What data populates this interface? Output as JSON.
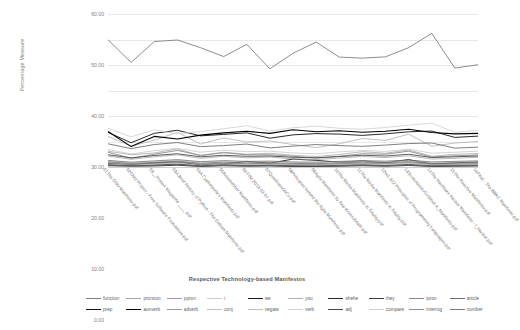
{
  "chart_data": {
    "type": "line",
    "title": "",
    "xlabel": "Respective Technology-based Manifestos",
    "ylabel": "Percentage Measure",
    "ylim": [
      0,
      60
    ],
    "yticks": [
      "0.00",
      "10.00",
      "20.00",
      "30.00",
      "40.00",
      "50.00",
      "60.00"
    ],
    "grid": true,
    "legend_position": "bottom",
    "categories": [
      "01The GNU Manifesto.pdf",
      "02GNU Project - Free Software Foundation.pdf",
      "03__Plone4 Magazine ____.pdf",
      "03A Brief History of Python - The Debian Manifesto.pdf",
      "04A Cypherpunk's Manifesto.pdf",
      "05Indiewebber Manifesto.pdf",
      "06TTM-2013-02-07.pdf",
      "07QuestionsOnCo.pdf",
      "08Principles behind the Agile Manifesto.pdf",
      "09Agile Manifesto by Ana Kronschnabl.pdf",
      "10The Media Manifesto in Totality.pdf",
      "11The Media Manifesto in Totality.pdf",
      "12m1-312 Principles of Programming Languages.pdf",
      "13TocksAndSoGoSmet-A_Manifesto.pdf",
      "14The Hardware Hacker Manifesto - I_Hacker.pdf",
      "15The Reactive Manifesto.pdf",
      "16Final - The BBKC Manifesto.pdf"
    ],
    "series": [
      {
        "name": "function",
        "color": "#808080",
        "width": 0.9,
        "values": [
          49.9,
          41.0,
          49.2,
          49.8,
          46.8,
          43.3,
          48.1,
          38.5,
          44.6,
          49.0,
          43.1,
          42.7,
          43.2,
          46.8,
          52.4,
          38.8,
          40.1
        ]
      },
      {
        "name": "pronoun",
        "color": "#a6a6a6",
        "width": 0.7,
        "values": [
          12.0,
          8.2,
          10.5,
          13.6,
          9.0,
          11.4,
          9.8,
          10.2,
          8.8,
          7.6,
          9.1,
          11.2,
          10.4,
          12.9,
          8.1,
          9.4,
          10.0
        ]
      },
      {
        "name": "ppron",
        "color": "#9c9c9c",
        "width": 0.7,
        "values": [
          6.2,
          4.8,
          5.5,
          7.1,
          4.4,
          5.8,
          5.0,
          5.4,
          4.6,
          4.1,
          4.9,
          6.0,
          5.4,
          6.7,
          4.2,
          5.0,
          5.3
        ]
      },
      {
        "name": "i",
        "color": "#cccccc",
        "width": 0.7,
        "values": [
          2.1,
          1.2,
          1.8,
          2.4,
          1.0,
          1.6,
          1.1,
          1.4,
          0.9,
          0.8,
          1.2,
          1.7,
          1.3,
          2.0,
          0.9,
          1.1,
          1.4
        ]
      },
      {
        "name": "we",
        "color": "#1a1a1a",
        "width": 0.9,
        "values": [
          1.4,
          0.9,
          1.6,
          2.0,
          0.8,
          1.2,
          2.2,
          1.5,
          3.1,
          2.6,
          1.9,
          2.4,
          1.7,
          2.9,
          1.2,
          1.6,
          2.0
        ]
      },
      {
        "name": "you",
        "color": "#b0b0b0",
        "width": 0.7,
        "values": [
          1.0,
          0.6,
          0.9,
          1.5,
          0.5,
          1.1,
          0.7,
          0.9,
          0.6,
          0.5,
          0.8,
          1.0,
          0.7,
          1.2,
          0.6,
          0.8,
          0.9
        ]
      },
      {
        "name": "shehe",
        "color": "#2b2b2b",
        "width": 0.9,
        "values": [
          0.5,
          0.3,
          0.4,
          0.7,
          0.2,
          0.5,
          0.3,
          0.4,
          0.2,
          0.2,
          0.3,
          0.5,
          0.3,
          0.6,
          0.2,
          0.3,
          0.4
        ]
      },
      {
        "name": "they",
        "color": "#3d3d3d",
        "width": 0.9,
        "values": [
          0.9,
          0.6,
          0.8,
          1.1,
          0.5,
          0.9,
          0.6,
          0.8,
          0.5,
          0.4,
          0.7,
          0.9,
          0.6,
          1.0,
          0.5,
          0.7,
          0.8
        ]
      },
      {
        "name": "ipron",
        "color": "#8a8a8a",
        "width": 0.9,
        "values": [
          5.8,
          3.4,
          5.0,
          6.5,
          4.6,
          5.6,
          4.8,
          4.8,
          4.2,
          3.5,
          4.2,
          5.2,
          5.0,
          6.2,
          3.9,
          4.4,
          4.7
        ]
      },
      {
        "name": "article",
        "color": "#707070",
        "width": 0.9,
        "values": [
          9.1,
          7.2,
          8.8,
          9.6,
          8.0,
          8.4,
          9.0,
          7.5,
          8.2,
          8.8,
          8.4,
          8.1,
          8.6,
          9.2,
          9.4,
          7.4,
          7.8
        ]
      },
      {
        "name": "prep",
        "color": "#111111",
        "width": 0.9,
        "values": [
          13.6,
          9.5,
          13.2,
          14.4,
          12.2,
          12.8,
          13.4,
          11.3,
          12.6,
          13.1,
          12.9,
          12.4,
          13.0,
          13.8,
          14.1,
          11.6,
          12.1
        ]
      },
      {
        "name": "auxverb",
        "color": "#000000",
        "width": 1.1,
        "values": [
          13.9,
          8.0,
          12.0,
          11.0,
          12.5,
          13.4,
          14.0,
          13.2,
          14.6,
          13.8,
          14.2,
          13.6,
          14.0,
          14.8,
          13.5,
          13.0,
          13.2
        ]
      },
      {
        "name": "adverb",
        "color": "#9a9a9a",
        "width": 0.7,
        "values": [
          4.3,
          3.0,
          4.0,
          4.8,
          3.4,
          4.2,
          3.6,
          3.9,
          3.2,
          2.9,
          3.5,
          4.1,
          3.7,
          4.4,
          3.1,
          3.4,
          3.8
        ]
      },
      {
        "name": "conj",
        "color": "#c2c2c2",
        "width": 0.7,
        "values": [
          6.9,
          5.1,
          6.4,
          7.3,
          5.8,
          6.6,
          6.0,
          6.2,
          5.5,
          5.2,
          5.9,
          6.5,
          6.1,
          7.0,
          5.4,
          5.8,
          6.2
        ]
      },
      {
        "name": "negate",
        "color": "#bdbdbd",
        "width": 0.7,
        "values": [
          1.2,
          0.8,
          1.1,
          1.5,
          0.7,
          1.2,
          0.9,
          1.1,
          0.8,
          0.6,
          1.0,
          1.2,
          0.9,
          1.3,
          0.7,
          0.9,
          1.0
        ]
      },
      {
        "name": "verb",
        "color": "#d4d4d4",
        "width": 0.9,
        "values": [
          15.2,
          11.8,
          14.6,
          13.0,
          13.9,
          15.0,
          16.2,
          14.1,
          15.4,
          16.0,
          15.2,
          14.8,
          15.5,
          16.4,
          17.2,
          13.6,
          14.4
        ]
      },
      {
        "name": "adj",
        "color": "#4a4a4a",
        "width": 0.9,
        "values": [
          4.8,
          3.6,
          4.5,
          5.2,
          4.0,
          4.6,
          4.2,
          4.3,
          3.8,
          3.6,
          4.1,
          4.6,
          4.3,
          5.0,
          3.7,
          4.0,
          4.3
        ]
      },
      {
        "name": "compare",
        "color": "#cfcfcf",
        "width": 0.7,
        "values": [
          2.4,
          1.8,
          2.2,
          2.7,
          1.9,
          2.3,
          2.0,
          2.1,
          1.8,
          1.7,
          2.0,
          2.3,
          2.1,
          2.5,
          1.8,
          2.0,
          2.2
        ]
      },
      {
        "name": "interrog",
        "color": "#8f8f8f",
        "width": 0.9,
        "values": [
          1.6,
          1.1,
          1.4,
          1.9,
          1.2,
          1.5,
          1.3,
          1.4,
          1.1,
          1.0,
          1.3,
          1.5,
          1.3,
          1.7,
          1.1,
          1.2,
          1.4
        ]
      },
      {
        "name": "number",
        "color": "#7a7a7a",
        "width": 0.9,
        "values": [
          2.0,
          1.4,
          1.8,
          2.3,
          1.5,
          1.9,
          1.6,
          1.7,
          1.4,
          1.3,
          1.6,
          1.9,
          1.7,
          2.1,
          1.4,
          1.6,
          1.8
        ]
      },
      {
        "name": "quant",
        "color": "#606060",
        "width": 0.7,
        "values": [
          2.6,
          1.9,
          2.4,
          2.9,
          2.1,
          2.5,
          2.2,
          2.3,
          2.0,
          1.9,
          2.2,
          2.5,
          2.3,
          2.7,
          2.0,
          2.2,
          2.4
        ]
      },
      {
        "name": "other",
        "color": "#5a5a5a",
        "width": 0.7,
        "values": [
          0.7,
          0.5,
          0.6,
          0.9,
          0.4,
          0.7,
          0.5,
          0.6,
          0.4,
          0.4,
          0.5,
          0.7,
          0.5,
          0.8,
          0.4,
          0.5,
          0.6
        ]
      }
    ]
  },
  "legend_rows": [
    [
      "function",
      "pronoun",
      "ppron",
      "i",
      "we",
      "you",
      "shehe",
      "they",
      "ipron",
      "article"
    ],
    [
      "prep",
      "auxverb",
      "adverb",
      "conj",
      "negate",
      "verb",
      "adj",
      "compare",
      "interrog",
      "number"
    ]
  ]
}
